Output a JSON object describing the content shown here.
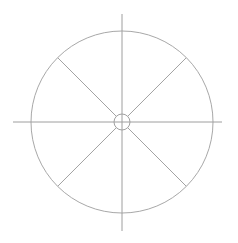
{
  "figure": {
    "name": "spoked-wheel-diagram",
    "background_color": "#ffffff",
    "width": 238,
    "height": 243
  },
  "style": {
    "line_color": "#a3a3a3",
    "rim_color": "#a8a8a8",
    "hub_color": "#a0a0a0",
    "axis_color": "#9e9e9e",
    "line_width": "1",
    "rim_width": "1",
    "hub_width": "1"
  },
  "geometry": {
    "center_x": 122,
    "center_y": 122,
    "rim_radius": 91,
    "hub_radius": 8,
    "axis_overhang": 17,
    "axis_left_x": 13,
    "axis_right_x": 222,
    "axis_top_y": 14,
    "axis_bottom_y": 231
  },
  "chart_data": {
    "type": "scatter",
    "xlabel": "",
    "ylabel": "",
    "grid": false,
    "legend": "none",
    "xlim": [
      0,
      238
    ],
    "ylim": [
      0,
      243
    ],
    "center": [
      122,
      122
    ],
    "rim_radius": 91,
    "hub_radius": 8,
    "spoke_count": 8,
    "spoke_angles_deg": [
      0,
      45,
      90,
      135,
      180,
      225,
      270,
      315
    ],
    "axis_spoke_angles_deg": [
      0,
      90,
      180,
      270
    ],
    "diagonal_spoke_angles_deg": [
      45,
      135,
      225,
      315
    ]
  },
  "elements": {
    "rim_label": "outer rim circle",
    "hub_label": "center hub circle",
    "axis_horizontal_label": "horizontal crosshair axis",
    "axis_vertical_label": "vertical crosshair axis",
    "spoke_ne_label": "spoke north-east",
    "spoke_nw_label": "spoke north-west",
    "spoke_sw_label": "spoke south-west",
    "spoke_se_label": "spoke south-east"
  },
  "spokes": [
    {
      "name": "spoke-nw",
      "angle_deg": 135,
      "x1": 116.3,
      "y1": 116.3,
      "x2": 57.7,
      "y2": 57.7
    },
    {
      "name": "spoke-ne",
      "angle_deg": 45,
      "x1": 127.7,
      "y1": 116.3,
      "x2": 186.3,
      "y2": 57.7
    },
    {
      "name": "spoke-sw",
      "angle_deg": 225,
      "x1": 116.3,
      "y1": 127.7,
      "x2": 57.7,
      "y2": 186.3
    },
    {
      "name": "spoke-se",
      "angle_deg": 315,
      "x1": 127.7,
      "y1": 127.7,
      "x2": 186.3,
      "y2": 186.3
    }
  ]
}
